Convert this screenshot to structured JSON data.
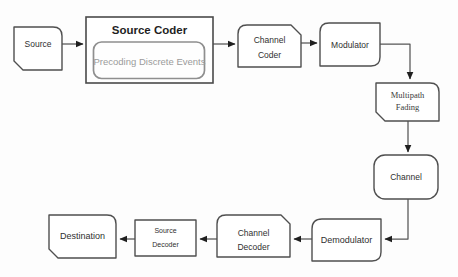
{
  "diagram": {
    "type": "flowchart",
    "colors": {
      "background": "#fdfdfd",
      "block_border": "#4f4f4f",
      "block_fill": "#ffffff",
      "inner_border": "#8f8f8f",
      "connector": "#565656",
      "arrowhead": "#1f1f1f",
      "label_text": "#2f2f2f",
      "title_text": "#1f1f1f",
      "muted_text": "#9b9b9b"
    },
    "blocks": {
      "source": {
        "label": "Source"
      },
      "source_coder": {
        "title": "Source Coder",
        "inner_label": "Precoding Discrete Events"
      },
      "channel_coder": {
        "line1": "Channel",
        "line2": "Coder"
      },
      "modulator": {
        "label": "Modulator"
      },
      "multipath_fading": {
        "line1": "Multipath",
        "line2": "Fading"
      },
      "channel": {
        "label": "Channel"
      },
      "demodulator": {
        "label": "Demodulator"
      },
      "channel_decoder": {
        "line1": "Channel",
        "line2": "Decoder"
      },
      "source_decoder": {
        "line1": "Source",
        "line2": "Decoder"
      },
      "destination": {
        "label": "Destination"
      }
    },
    "edges": [
      {
        "from": "Source",
        "to": "Source Coder"
      },
      {
        "from": "Source Coder",
        "to": "Channel Coder"
      },
      {
        "from": "Channel Coder",
        "to": "Modulator"
      },
      {
        "from": "Modulator",
        "to": "Multipath Fading"
      },
      {
        "from": "Multipath Fading",
        "to": "Channel"
      },
      {
        "from": "Channel",
        "to": "Demodulator"
      },
      {
        "from": "Demodulator",
        "to": "Channel Decoder"
      },
      {
        "from": "Channel Decoder",
        "to": "Source Decoder"
      },
      {
        "from": "Source Decoder",
        "to": "Destination"
      }
    ]
  }
}
